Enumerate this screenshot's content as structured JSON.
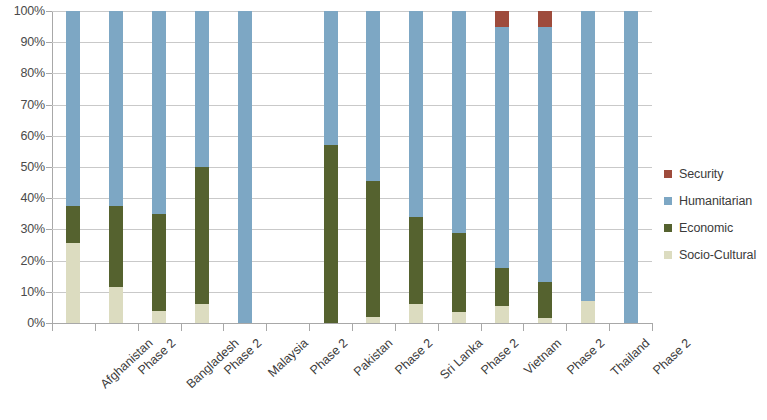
{
  "chart_data": {
    "type": "bar",
    "title": "",
    "subtitle": "",
    "xlabel": "",
    "ylabel": "",
    "stacked": true,
    "stack_mode": "percent",
    "ylim": [
      0,
      100
    ],
    "grid": true,
    "legend_position": "right",
    "y_ticks": [
      "0%",
      "10%",
      "20%",
      "30%",
      "40%",
      "50%",
      "60%",
      "70%",
      "80%",
      "90%",
      "100%"
    ],
    "y_tick_values": [
      0,
      10,
      20,
      30,
      40,
      50,
      60,
      70,
      80,
      90,
      100
    ],
    "categories": [
      "Afghanistan",
      "Phase 2",
      "Bangladesh",
      "Phase 2",
      "Malaysia",
      "Phase 2",
      "Pakistan",
      "Phase 2",
      "Sri Lanka",
      "Phase 2",
      "Vietnam",
      "Phase 2",
      "Thailand",
      "Phase 2"
    ],
    "series": [
      {
        "name": "Socio-Cultural",
        "color": "#dcdcc0",
        "values": [
          25.5,
          11.5,
          4.0,
          6.0,
          0,
          null,
          0,
          2.0,
          6.0,
          3.5,
          5.5,
          1.5,
          7.0,
          0
        ]
      },
      {
        "name": "Economic",
        "color": "#55622f",
        "values": [
          12.0,
          26.0,
          31.0,
          44.0,
          0,
          null,
          57.0,
          43.5,
          28.0,
          25.5,
          12.0,
          11.5,
          0,
          0
        ]
      },
      {
        "name": "Humanitarian",
        "color": "#7da7c4",
        "values": [
          62.5,
          62.5,
          65.0,
          50.0,
          100,
          null,
          43.0,
          54.5,
          66.0,
          71.0,
          77.5,
          82.0,
          93.0,
          100
        ]
      },
      {
        "name": "Security",
        "color": "#9e4b3c",
        "values": [
          0,
          0,
          0,
          0,
          0,
          null,
          0,
          0,
          0,
          0,
          5.0,
          5.0,
          0,
          0
        ]
      }
    ]
  },
  "legend": {
    "items": [
      {
        "label": "Security",
        "color": "#9e4b3c"
      },
      {
        "label": "Humanitarian",
        "color": "#7da7c4"
      },
      {
        "label": "Economic",
        "color": "#55622f"
      },
      {
        "label": "Socio-Cultural",
        "color": "#dcdcc0"
      }
    ]
  }
}
